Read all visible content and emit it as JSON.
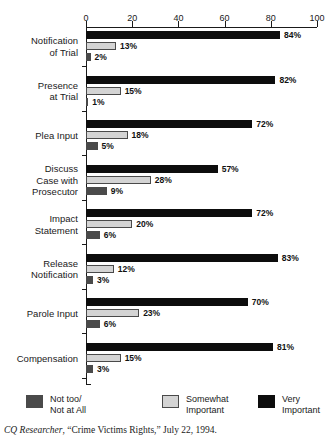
{
  "chart_data": {
    "type": "bar",
    "orientation": "horizontal",
    "grouped": true,
    "title": "",
    "xlabel": "",
    "ylabel": "",
    "xlim": [
      0,
      100
    ],
    "xticks": [
      0,
      20,
      40,
      60,
      80,
      100
    ],
    "xtick_labels": [
      "0",
      "20",
      "40",
      "60",
      "80",
      "100"
    ],
    "grid": false,
    "legend_position": "bottom",
    "value_suffix": "%",
    "categories": [
      "Notification\nof Trial",
      "Presence\nat Trial",
      "Plea Input",
      "Discuss\nCase with\nProsecutor",
      "Impact\nStatement",
      "Release\nNotification",
      "Parole Input",
      "Compensation"
    ],
    "series": [
      {
        "name": "Very Important",
        "color": "#0d0d0d",
        "values": [
          84,
          82,
          72,
          57,
          72,
          83,
          70,
          81
        ],
        "labels": [
          "84%",
          "82%",
          "72%",
          "57%",
          "72%",
          "83%",
          "70%",
          "81%"
        ]
      },
      {
        "name": "Somewhat Important",
        "color": "#d4d4d4",
        "values": [
          13,
          15,
          18,
          28,
          20,
          12,
          23,
          15
        ],
        "labels": [
          "13%",
          "15%",
          "18%",
          "28%",
          "20%",
          "12%",
          "23%",
          "15%"
        ]
      },
      {
        "name": "Not too/ Not at All",
        "color": "#4a4a4a",
        "values": [
          2,
          1,
          5,
          9,
          6,
          3,
          6,
          3
        ],
        "labels": [
          "2%",
          "1%",
          "5%",
          "9%",
          "6%",
          "3%",
          "6%",
          "3%"
        ]
      }
    ]
  },
  "legend": {
    "items": [
      {
        "key": "nottoo",
        "label": "Not too/\nNot at All",
        "color": "#4a4a4a"
      },
      {
        "key": "somewhat",
        "label": "Somewhat\nImportant",
        "color": "#d4d4d4"
      },
      {
        "key": "very",
        "label": "Very Important",
        "color": "#0d0d0d"
      }
    ]
  },
  "caption": {
    "source": "CQ Researcher",
    "rest": ", “Crime Victims Rights,” July 22, 1994."
  }
}
